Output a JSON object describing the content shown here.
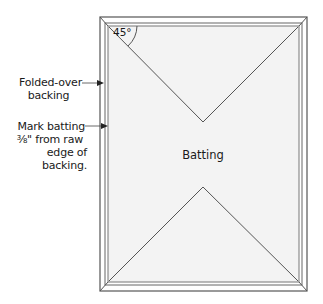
{
  "diagram": {
    "center_label": "Batting",
    "angle_label": "45°",
    "callouts": [
      {
        "id": "folded-over-backing",
        "lines": [
          "Folded-over",
          "backing"
        ]
      },
      {
        "id": "mark-batting",
        "lines": [
          "Mark batting",
          "⅜\" from raw",
          "edge of backing."
        ]
      }
    ],
    "colors": {
      "batting_fill": "#f4f4f4",
      "line": "#444444",
      "backing_fill": "#ffffff"
    }
  }
}
